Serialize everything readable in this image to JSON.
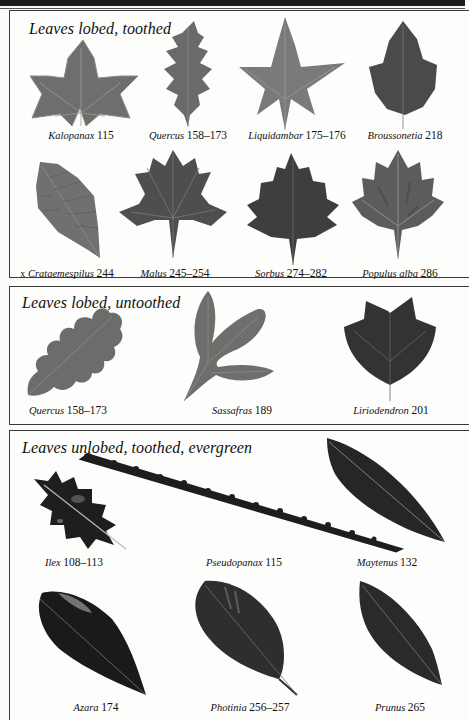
{
  "page": {
    "sections": [
      {
        "title": "Leaves lobed, toothed",
        "items": [
          {
            "prefix": "",
            "genus": "Kalopanax",
            "pages": "115"
          },
          {
            "prefix": "",
            "genus": "Quercus",
            "pages": "158–173"
          },
          {
            "prefix": "",
            "genus": "Liquidambar",
            "pages": "175–176"
          },
          {
            "prefix": "",
            "genus": "Broussonetia",
            "pages": "218"
          },
          {
            "prefix": "x",
            "genus": "Crataemespilus",
            "pages": "244"
          },
          {
            "prefix": "",
            "genus": "Malus",
            "pages": "245–254"
          },
          {
            "prefix": "",
            "genus": "Sorbus",
            "pages": "274–282"
          },
          {
            "prefix": "",
            "genus": "Populus alba",
            "pages": "286"
          }
        ]
      },
      {
        "title": "Leaves lobed, untoothed",
        "items": [
          {
            "prefix": "",
            "genus": "Quercus",
            "pages": "158–173"
          },
          {
            "prefix": "",
            "genus": "Sassafras",
            "pages": "189"
          },
          {
            "prefix": "",
            "genus": "Liriodendron",
            "pages": "201"
          }
        ]
      },
      {
        "title": "Leaves unlobed, toothed, evergreen",
        "items": [
          {
            "prefix": "",
            "genus": "Ilex",
            "pages": "108–113"
          },
          {
            "prefix": "",
            "genus": "Pseudopanax",
            "pages": "115"
          },
          {
            "prefix": "",
            "genus": "Maytenus",
            "pages": "132"
          },
          {
            "prefix": "",
            "genus": "Azara",
            "pages": "174"
          },
          {
            "prefix": "",
            "genus": "Photinia",
            "pages": "256–257"
          },
          {
            "prefix": "",
            "genus": "Prunus",
            "pages": "265"
          }
        ]
      }
    ],
    "colors": {
      "leaf_light": "#7a7a78",
      "leaf_mid": "#5a5a58",
      "leaf_dark": "#3c3c3a",
      "leaf_black": "#1c1c1c",
      "border": "#3a3a3a"
    }
  }
}
